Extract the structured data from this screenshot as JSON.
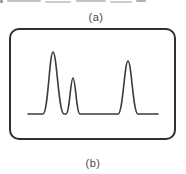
{
  "figure": {
    "top_label": "(a)",
    "bottom_label": "(b)"
  },
  "colors": {
    "background": "#ffffff",
    "trace": "#3b3b3b",
    "frame_border": "#2f2f2f",
    "label_text": "#4a4a4a"
  },
  "trace": {
    "type": "line",
    "description": "Schematic chromatogram/recorder trace: flat baseline with three narrow peaks (tall, short, medium-tall) inside a rounded rectangular display frame",
    "baseline": {
      "y": 114,
      "x_start": 28,
      "x_end": 158
    },
    "peaks": [
      {
        "index": 1,
        "x_left": 43,
        "x_center": 53,
        "x_right": 64,
        "y_top": 52,
        "relative_height": 62
      },
      {
        "index": 2,
        "x_left": 66,
        "x_center": 73,
        "x_right": 80,
        "y_top": 78,
        "relative_height": 36
      },
      {
        "index": 3,
        "x_left": 118,
        "x_center": 128,
        "x_right": 138,
        "y_top": 61,
        "relative_height": 53
      }
    ]
  }
}
